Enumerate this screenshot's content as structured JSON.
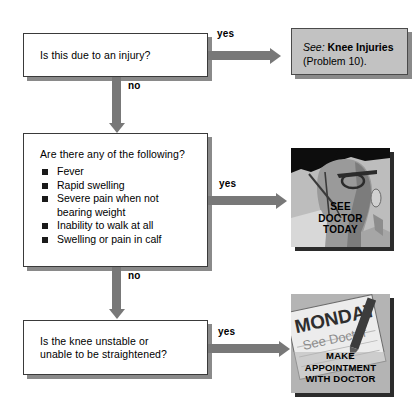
{
  "flowchart": {
    "title": "Knee problem decision flowchart",
    "colors": {
      "arrow": "#787878",
      "box_border": "#3a3a3a",
      "box_shadow": "#8a8a8a",
      "reference_box_fill": "#c2c2c2",
      "picture_shadow": "#2b2b2b",
      "bullet": "#1a1a1a",
      "page_background": "#ffffff"
    },
    "nodes": [
      {
        "id": "q1",
        "type": "question",
        "text": "Is this due to an injury?"
      },
      {
        "id": "q2",
        "type": "question-list",
        "prompt": "Are there any of the following?",
        "items": [
          "Fever",
          "Rapid swelling",
          "Severe pain when not\nbearing weight",
          "Inability to walk at all",
          "Swelling or pain in calf"
        ]
      },
      {
        "id": "q3",
        "type": "question",
        "text": "Is the knee unstable or\nunable to be straightened?"
      }
    ],
    "outcomes": [
      {
        "id": "o1",
        "type": "reference",
        "lead": "See:",
        "topic": "Knee Injuries",
        "detail": "(Problem 10)."
      },
      {
        "id": "o2",
        "type": "picture",
        "caption_lines": [
          "SEE",
          "DOCTOR",
          "TODAY"
        ],
        "alt": "doctor in profile wearing glasses"
      },
      {
        "id": "o3",
        "type": "picture",
        "calendar_day": "MONDAY",
        "calendar_note": "See Doctor",
        "caption_lines": [
          "MAKE",
          "APPOINTMENT",
          "WITH DOCTOR"
        ],
        "alt": "calendar page with pen"
      }
    ],
    "edges": [
      {
        "id": "e1",
        "label": "yes",
        "direction": "right",
        "from": "q1",
        "to": "o1"
      },
      {
        "id": "e2",
        "label": "no",
        "direction": "down",
        "from": "q1",
        "to": "q2"
      },
      {
        "id": "e3",
        "label": "yes",
        "direction": "right",
        "from": "q2",
        "to": "o2"
      },
      {
        "id": "e4",
        "label": "no",
        "direction": "down",
        "from": "q2",
        "to": "q3"
      },
      {
        "id": "e5",
        "label": "yes",
        "direction": "right",
        "from": "q3",
        "to": "o3"
      }
    ]
  }
}
